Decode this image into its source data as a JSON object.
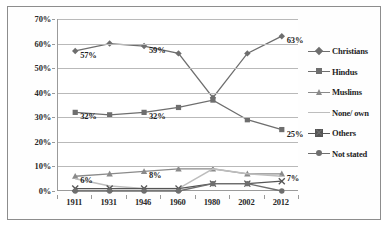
{
  "chart_data": {
    "type": "line",
    "title": "",
    "subtitle": "",
    "xlabel": "",
    "ylabel": "",
    "categories": [
      "1911",
      "1931",
      "1946",
      "1960",
      "1980",
      "2002",
      "2012"
    ],
    "ylim": [
      0,
      70
    ],
    "y_ticks": [
      "0%",
      "10%",
      "20%",
      "30%",
      "40%",
      "50%",
      "60%",
      "70%"
    ],
    "y_tick_values": [
      0,
      10,
      20,
      30,
      40,
      50,
      60,
      70
    ],
    "grid": true,
    "grid_axis": "y",
    "legend_position": "right",
    "series": [
      {
        "name": "Christians",
        "marker": "diamond",
        "color": "#6e6e6e",
        "values": [
          57,
          60,
          59,
          56,
          38,
          56,
          63
        ],
        "labels": [
          {
            "index": 0,
            "text": "57%"
          },
          {
            "index": 2,
            "text": "59%"
          },
          {
            "index": 6,
            "text": "63%"
          }
        ]
      },
      {
        "name": "Hindus",
        "marker": "square",
        "color": "#6e6e6e",
        "values": [
          32,
          31,
          32,
          34,
          37,
          29,
          25
        ],
        "labels": [
          {
            "index": 0,
            "text": "32%"
          },
          {
            "index": 2,
            "text": "32%"
          },
          {
            "index": 6,
            "text": "25%"
          }
        ]
      },
      {
        "name": "Muslims",
        "marker": "triangle",
        "color": "#8a8a8a",
        "values": [
          6,
          7,
          8,
          9,
          9,
          7,
          7
        ],
        "labels": [
          {
            "index": 0,
            "text": "6%"
          },
          {
            "index": 2,
            "text": "8%"
          },
          {
            "index": 6,
            "text": "7%"
          }
        ]
      },
      {
        "name": "None/ own",
        "marker": "none",
        "color": "#bdbdbd",
        "values": [
          5,
          2,
          1,
          1,
          9,
          7,
          6
        ],
        "labels": []
      },
      {
        "name": "Others",
        "marker": "x",
        "color": "#555555",
        "values": [
          1,
          1,
          1,
          1,
          3,
          3,
          4
        ],
        "labels": []
      },
      {
        "name": "Not stated",
        "marker": "circle",
        "color": "#6e6e6e",
        "values": [
          0,
          0,
          0,
          0,
          3,
          3,
          0
        ],
        "labels": []
      }
    ]
  }
}
